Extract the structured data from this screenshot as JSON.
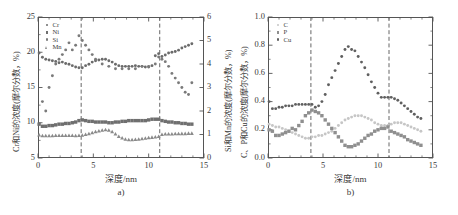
{
  "figure": {
    "panels": [
      {
        "id": "a",
        "caption": "a)",
        "xlabel": "深度/nm",
        "ylabel_left": "Cr和Ni的浓度(摩尔分数，%)",
        "ylabel_right": "Si和Mn的浓度(摩尔分数，%)",
        "xticks": [
          "0",
          "5",
          "10",
          "15"
        ],
        "yticks_left": [
          "5",
          "10",
          "15",
          "20",
          "25"
        ],
        "yticks_right": [
          "0",
          "1",
          "2",
          "3",
          "4",
          "5",
          "6"
        ],
        "legend": [
          {
            "label": "Cr",
            "marker": "dot",
            "color": "#6b6b6b"
          },
          {
            "label": "Ni",
            "marker": "square",
            "color": "#6f6f6f"
          },
          {
            "label": "Si",
            "marker": "dot",
            "color": "#7a7a7a"
          },
          {
            "label": "Mn",
            "marker": "triangle",
            "color": "#8a8a8a"
          }
        ]
      },
      {
        "id": "b",
        "caption": "b)",
        "xlabel": "深度/nm",
        "ylabel_left": "C、P和Cu的浓度(摩尔分数，%)",
        "xticks": [
          "0",
          "5",
          "10",
          "15"
        ],
        "yticks_left": [
          "0.0",
          "0.2",
          "0.4",
          "0.6",
          "0.8",
          "1.0"
        ],
        "legend": [
          {
            "label": "C",
            "marker": "dot",
            "color": "#c6c6c6"
          },
          {
            "label": "P",
            "marker": "square",
            "color": "#8f8f8f"
          },
          {
            "label": "Cu",
            "marker": "dot",
            "color": "#5f5f5f"
          }
        ]
      }
    ]
  },
  "chart_data": [
    {
      "type": "scatter",
      "panel": "a",
      "title": "",
      "xlabel": "深度/nm",
      "ylabel": "Cr和Ni的浓度(摩尔分数，%)",
      "ylabel_secondary": "Si和Mn的浓度(摩尔分数，%)",
      "xlim": [
        0,
        15
      ],
      "ylim": [
        5,
        25
      ],
      "ylim_secondary": [
        0,
        6
      ],
      "grid": false,
      "legend_position": "top-left",
      "vlines": [
        3.9,
        11.0
      ],
      "series": [
        {
          "name": "Cr",
          "axis": "left",
          "marker": "dot",
          "color": "#6b6b6b",
          "x": [
            0.1,
            0.4,
            0.7,
            1.0,
            1.3,
            1.6,
            1.9,
            2.2,
            2.5,
            2.8,
            3.1,
            3.4,
            3.7,
            4.0,
            4.3,
            4.6,
            4.9,
            5.2,
            5.5,
            5.8,
            6.1,
            6.4,
            6.7,
            7.0,
            7.3,
            7.6,
            7.9,
            8.2,
            8.5,
            8.8,
            9.1,
            9.4,
            9.7,
            10.0,
            10.3,
            10.6,
            10.9,
            11.2,
            11.5,
            11.8,
            12.1,
            12.4,
            12.7,
            13.0,
            13.3,
            13.6,
            13.9
          ],
          "y": [
            19.9,
            19.3,
            19.0,
            18.9,
            18.8,
            18.7,
            18.5,
            18.6,
            18.4,
            18.3,
            18.1,
            17.9,
            17.8,
            17.8,
            18.1,
            18.3,
            18.6,
            18.8,
            18.9,
            19.0,
            19.0,
            18.8,
            18.6,
            18.3,
            18.1,
            18.0,
            18.0,
            18.0,
            18.0,
            18.1,
            18.0,
            18.0,
            17.9,
            17.9,
            18.1,
            19.5,
            19.8,
            19.4,
            19.6,
            19.9,
            20.0,
            20.1,
            20.3,
            20.6,
            20.8,
            21.0,
            21.2
          ]
        },
        {
          "name": "Ni",
          "axis": "left",
          "marker": "square",
          "color": "#6f6f6f",
          "x": [
            0.1,
            0.4,
            0.7,
            1.0,
            1.3,
            1.6,
            1.9,
            2.2,
            2.5,
            2.8,
            3.1,
            3.4,
            3.7,
            4.0,
            4.3,
            4.6,
            4.9,
            5.2,
            5.5,
            5.8,
            6.1,
            6.4,
            6.7,
            7.0,
            7.3,
            7.6,
            7.9,
            8.2,
            8.5,
            8.8,
            9.1,
            9.4,
            9.7,
            10.0,
            10.3,
            10.6,
            10.9,
            11.2,
            11.5,
            11.8,
            12.1,
            12.4,
            12.7,
            13.0,
            13.3,
            13.6,
            13.9
          ],
          "y": [
            9.8,
            9.5,
            9.5,
            9.6,
            9.6,
            9.7,
            9.8,
            9.8,
            9.9,
            9.9,
            10.0,
            10.1,
            10.3,
            10.4,
            10.3,
            10.2,
            10.2,
            10.1,
            10.1,
            10.1,
            10.1,
            10.0,
            10.0,
            10.1,
            10.1,
            10.2,
            10.2,
            10.3,
            10.3,
            10.3,
            10.3,
            10.3,
            10.3,
            10.4,
            10.5,
            10.5,
            10.5,
            10.3,
            10.2,
            10.1,
            10.1,
            10.0,
            10.0,
            9.9,
            9.9,
            9.8,
            9.8
          ]
        },
        {
          "name": "Si",
          "axis": "right",
          "marker": "dot",
          "color": "#7a7a7a",
          "x": [
            0.4,
            0.7,
            1.0,
            1.3,
            1.6,
            1.9,
            2.2,
            2.5,
            2.8,
            3.1,
            3.4,
            3.7,
            4.0,
            4.3,
            4.6,
            4.9,
            5.2,
            5.8,
            6.4,
            7.0,
            7.6,
            8.2,
            8.8,
            9.4,
            10.0,
            10.6,
            10.9,
            11.2,
            11.5,
            11.8,
            12.1,
            12.4,
            12.7,
            13.0,
            13.3,
            13.6,
            13.9
          ],
          "y": [
            2.4,
            2.0,
            3.0,
            3.5,
            4.0,
            4.2,
            4.4,
            4.6,
            4.9,
            4.6,
            4.8,
            5.2,
            5.0,
            4.8,
            4.6,
            4.4,
            4.2,
            4.0,
            3.9,
            3.8,
            3.8,
            3.8,
            3.8,
            3.9,
            3.9,
            4.0,
            4.3,
            4.2,
            4.1,
            3.9,
            3.6,
            3.4,
            3.2,
            3.0,
            2.8,
            2.7,
            3.2
          ]
        },
        {
          "name": "Mn",
          "axis": "right",
          "marker": "triangle",
          "color": "#8a8a8a",
          "x": [
            0.1,
            0.4,
            0.7,
            1.0,
            1.3,
            1.6,
            1.9,
            2.2,
            2.5,
            2.8,
            3.1,
            3.4,
            3.7,
            4.0,
            4.3,
            4.6,
            4.9,
            5.2,
            5.5,
            5.8,
            6.1,
            6.4,
            6.7,
            7.0,
            7.3,
            7.6,
            7.9,
            8.2,
            8.5,
            8.8,
            9.1,
            9.4,
            9.7,
            10.0,
            10.3,
            10.6,
            10.9,
            11.2,
            11.5,
            11.8,
            12.1,
            12.4,
            12.7,
            13.0,
            13.3,
            13.6,
            13.9
          ],
          "y": [
            0.98,
            0.95,
            0.95,
            0.95,
            0.95,
            0.96,
            0.96,
            0.96,
            0.96,
            0.96,
            0.96,
            0.95,
            0.96,
            0.97,
            1.0,
            1.03,
            1.08,
            1.12,
            1.15,
            1.18,
            1.2,
            1.18,
            1.12,
            1.02,
            0.92,
            0.85,
            0.8,
            0.78,
            0.78,
            0.79,
            0.8,
            0.82,
            0.84,
            0.86,
            0.88,
            0.9,
            0.92,
            1.0,
            1.02,
            1.02,
            1.02,
            1.03,
            1.03,
            1.04,
            1.04,
            1.05,
            1.05
          ]
        }
      ]
    },
    {
      "type": "scatter",
      "panel": "b",
      "title": "",
      "xlabel": "深度/nm",
      "ylabel": "C、P和Cu的浓度(摩尔分数，%)",
      "xlim": [
        0,
        15
      ],
      "ylim": [
        0.0,
        1.0
      ],
      "grid": false,
      "legend_position": "top-left",
      "vlines": [
        3.9,
        11.0
      ],
      "series": [
        {
          "name": "C",
          "marker": "dot",
          "color": "#c6c6c6",
          "x": [
            0.1,
            0.4,
            0.7,
            1.0,
            1.3,
            1.6,
            1.9,
            2.2,
            2.5,
            2.8,
            3.1,
            3.4,
            3.7,
            4.0,
            4.3,
            4.6,
            4.9,
            5.2,
            5.5,
            5.8,
            6.1,
            6.4,
            6.7,
            7.0,
            7.3,
            7.6,
            7.9,
            8.2,
            8.5,
            8.8,
            9.1,
            9.4,
            9.7,
            10.0,
            10.3,
            10.6,
            10.9,
            11.2,
            11.5,
            11.8,
            12.1,
            12.4,
            12.7,
            13.0,
            13.3,
            13.6,
            13.9
          ],
          "y": [
            0.24,
            0.23,
            0.22,
            0.22,
            0.21,
            0.2,
            0.19,
            0.18,
            0.17,
            0.16,
            0.15,
            0.14,
            0.14,
            0.15,
            0.15,
            0.16,
            0.16,
            0.17,
            0.18,
            0.19,
            0.21,
            0.23,
            0.25,
            0.27,
            0.28,
            0.29,
            0.3,
            0.3,
            0.3,
            0.29,
            0.28,
            0.27,
            0.25,
            0.24,
            0.23,
            0.23,
            0.23,
            0.24,
            0.25,
            0.25,
            0.25,
            0.24,
            0.23,
            0.22,
            0.21,
            0.2,
            0.19
          ]
        },
        {
          "name": "P",
          "marker": "square",
          "color": "#8f8f8f",
          "x": [
            0.1,
            0.4,
            0.7,
            1.0,
            1.3,
            1.6,
            1.9,
            2.2,
            2.5,
            2.8,
            3.1,
            3.4,
            3.7,
            4.0,
            4.3,
            4.6,
            4.9,
            5.2,
            5.5,
            5.8,
            6.1,
            6.4,
            6.7,
            7.0,
            7.3,
            7.6,
            7.9,
            8.2,
            8.5,
            8.8,
            9.1,
            9.4,
            9.7,
            10.0,
            10.3,
            10.6,
            10.9,
            11.2,
            11.5,
            11.8,
            12.1,
            12.4,
            12.7,
            13.0,
            13.3,
            13.6,
            13.9
          ],
          "y": [
            0.2,
            0.19,
            0.16,
            0.16,
            0.17,
            0.18,
            0.19,
            0.21,
            0.2,
            0.23,
            0.26,
            0.3,
            0.32,
            0.34,
            0.33,
            0.32,
            0.3,
            0.27,
            0.24,
            0.21,
            0.18,
            0.15,
            0.12,
            0.09,
            0.08,
            0.08,
            0.09,
            0.1,
            0.12,
            0.14,
            0.16,
            0.17,
            0.19,
            0.2,
            0.21,
            0.21,
            0.22,
            0.19,
            0.18,
            0.17,
            0.16,
            0.15,
            0.13,
            0.12,
            0.11,
            0.1,
            0.09
          ]
        },
        {
          "name": "Cu",
          "marker": "dot",
          "color": "#5f5f5f",
          "x": [
            0.1,
            0.4,
            0.7,
            1.0,
            1.3,
            1.6,
            1.9,
            2.2,
            2.5,
            2.8,
            3.1,
            3.4,
            3.7,
            4.0,
            4.3,
            4.6,
            4.9,
            5.2,
            5.5,
            5.8,
            6.1,
            6.4,
            6.7,
            7.0,
            7.3,
            7.6,
            7.9,
            8.2,
            8.5,
            8.8,
            9.1,
            9.4,
            9.7,
            10.0,
            10.3,
            10.6,
            10.9,
            11.2,
            11.5,
            11.8,
            12.1,
            12.4,
            12.7,
            13.0,
            13.3,
            13.6,
            13.9
          ],
          "y": [
            0.4,
            0.35,
            0.35,
            0.36,
            0.36,
            0.37,
            0.37,
            0.37,
            0.38,
            0.38,
            0.38,
            0.38,
            0.38,
            0.38,
            0.36,
            0.37,
            0.4,
            0.45,
            0.52,
            0.57,
            0.62,
            0.67,
            0.72,
            0.77,
            0.79,
            0.77,
            0.76,
            0.72,
            0.68,
            0.64,
            0.59,
            0.54,
            0.5,
            0.46,
            0.43,
            0.43,
            0.43,
            0.43,
            0.42,
            0.41,
            0.39,
            0.37,
            0.35,
            0.33,
            0.31,
            0.29,
            0.28
          ]
        }
      ]
    }
  ]
}
